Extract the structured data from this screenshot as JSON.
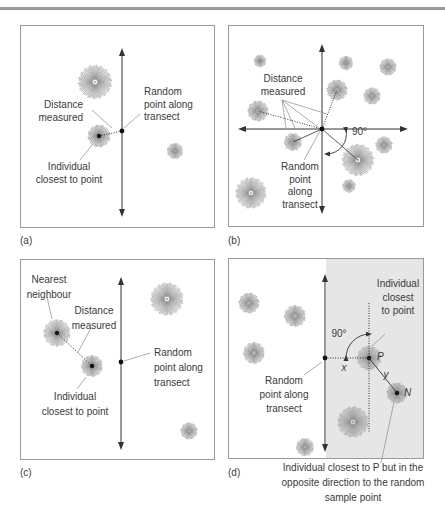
{
  "figure": {
    "panels": [
      {
        "id": "a",
        "label": "(a)",
        "annotations": {
          "random_point": [
            "Random",
            "point along",
            "transect"
          ],
          "distance": [
            "Distance",
            "measured"
          ],
          "individual": [
            "Individual",
            "closest to point"
          ]
        }
      },
      {
        "id": "b",
        "label": "(b)",
        "annotations": {
          "distance": [
            "Distance",
            "measured"
          ],
          "angle": "90°",
          "random_point": [
            "Random",
            "point",
            "along",
            "transect"
          ]
        }
      },
      {
        "id": "c",
        "label": "(c)",
        "annotations": {
          "nearest": [
            "Nearest",
            "neighbour"
          ],
          "distance": [
            "Distance",
            "measured"
          ],
          "random_point": [
            "Random",
            "point along",
            "transect"
          ],
          "individual": [
            "Individual",
            "closest to point"
          ]
        }
      },
      {
        "id": "d",
        "label": "(d)",
        "annotations": {
          "individual": [
            "Individual",
            "closest",
            "to point"
          ],
          "angle": "90°",
          "x": "x",
          "y": "y",
          "P": "P",
          "N": "N",
          "random_point": [
            "Random",
            "point along",
            "transect"
          ],
          "caption": [
            "Individual closest to P but in the",
            "opposite direction to the random",
            "sample point"
          ]
        }
      }
    ]
  },
  "colors": {
    "frame": "#9a9a9a",
    "line": "#333333",
    "leader": "#8a8a8a",
    "plant": "#8c8c8c",
    "shade": "#e6e6e6"
  }
}
